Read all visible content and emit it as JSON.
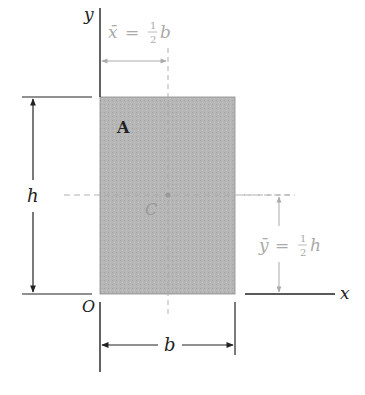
{
  "figure": {
    "type": "rectangle-centroid",
    "area_label": "A",
    "centroid_label": "C",
    "origin_label": "O",
    "axes": {
      "x_label": "x",
      "y_label": "y"
    },
    "dimensions": {
      "width_label": "b",
      "height_label": "h"
    },
    "centroid_formulas": {
      "x_bar": {
        "lhs": "x̄",
        "eq": "=",
        "num": "1",
        "den": "2",
        "var": "b"
      },
      "y_bar": {
        "lhs": "ȳ",
        "eq": "=",
        "num": "1",
        "den": "2",
        "var": "h"
      }
    },
    "colors": {
      "fill": "#b4b4b4",
      "stroke": "#333333",
      "axis": "#222222",
      "faded": "#aaaaaa"
    }
  }
}
